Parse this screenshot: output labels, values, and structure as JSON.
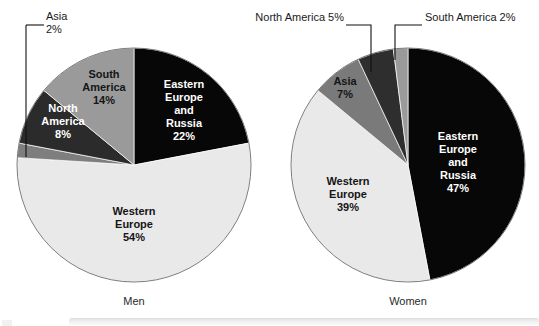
{
  "figure": {
    "background_color": "#ffffff",
    "charts": [
      {
        "id": "men",
        "caption": "Men",
        "caption_x": 134,
        "caption_y": 305,
        "center_x": 134,
        "center_y": 165,
        "radius": 117
      },
      {
        "id": "women",
        "caption": "Women",
        "caption_x": 408,
        "caption_y": 305,
        "center_x": 408,
        "center_y": 165,
        "radius": 117
      }
    ]
  },
  "chart_data": [
    {
      "type": "pie",
      "title": "Men",
      "start_angle_deg": 0,
      "direction": "clockwise",
      "total": 100,
      "unit": "%",
      "categories": [
        "Eastern Europe and Russia",
        "Western Europe",
        "Asia",
        "North America",
        "South America"
      ],
      "values": [
        22,
        54,
        2,
        8,
        14
      ],
      "slices": [
        {
          "label": "Eastern Europe and Russia",
          "label_lines": [
            "Eastern",
            "Europe",
            "and",
            "Russia"
          ],
          "value": 22,
          "value_text": "22%",
          "color": "#070707",
          "text_color": "#ffffff",
          "label_placement": "inside",
          "label_x": 184,
          "label_y": 88
        },
        {
          "label": "Western Europe",
          "label_lines": [
            "Western",
            "Europe"
          ],
          "value": 54,
          "value_text": "54%",
          "color": "#e9e9e9",
          "text_color": "#151515",
          "label_placement": "inside",
          "label_x": 134,
          "label_y": 215
        },
        {
          "label": "Asia",
          "label_lines": [
            "Asia"
          ],
          "value": 2,
          "value_text": "2%",
          "color": "#7e7e7e",
          "text_color": "#1a1a1a",
          "label_placement": "callout",
          "label_x": 46,
          "label_y": 20,
          "leader_points": "26,25 26,157"
        },
        {
          "label": "North America",
          "label_lines": [
            "North",
            "America"
          ],
          "value": 8,
          "value_text": "8%",
          "color": "#2b2b2b",
          "text_color": "#ffffff",
          "label_placement": "inside",
          "label_x": 63,
          "label_y": 112
        },
        {
          "label": "South America",
          "label_lines": [
            "South",
            "America"
          ],
          "value": 14,
          "value_text": "14%",
          "color": "#9a9a9a",
          "text_color": "#151515",
          "label_placement": "inside",
          "label_x": 104,
          "label_y": 78
        }
      ]
    },
    {
      "type": "pie",
      "title": "Women",
      "start_angle_deg": 0,
      "direction": "clockwise",
      "total": 100,
      "unit": "%",
      "categories": [
        "Eastern Europe and Russia",
        "Western Europe",
        "Asia",
        "North America",
        "South America"
      ],
      "values": [
        47,
        39,
        7,
        5,
        2
      ],
      "slices": [
        {
          "label": "Eastern Europe and Russia",
          "label_lines": [
            "Eastern",
            "Europe",
            "and",
            "Russia"
          ],
          "value": 47,
          "value_text": "47%",
          "color": "#070707",
          "text_color": "#ffffff",
          "label_placement": "inside",
          "label_x": 458,
          "label_y": 140
        },
        {
          "label": "Western Europe",
          "label_lines": [
            "Western",
            "Europe"
          ],
          "value": 39,
          "value_text": "39%",
          "color": "#e9e9e9",
          "text_color": "#151515",
          "label_placement": "inside",
          "label_x": 348,
          "label_y": 185
        },
        {
          "label": "Asia",
          "label_lines": [
            "Asia"
          ],
          "value": 7,
          "value_text": "7%",
          "color": "#7a7a7a",
          "text_color": "#151515",
          "label_placement": "inside",
          "label_x": 345,
          "label_y": 85
        },
        {
          "label": "North America",
          "label_lines": [
            "North America"
          ],
          "value": 5,
          "value_text": "5%",
          "color": "#2e2e2e",
          "text_color": "#1a1a1a",
          "label_placement": "callout",
          "label_text": "North America 5%",
          "label_x": 254,
          "label_y": 24,
          "leader_points": "346,25 371,25 371,72"
        },
        {
          "label": "South America",
          "label_lines": [
            "South America"
          ],
          "value": 2,
          "value_text": "2%",
          "color": "#9a9a9a",
          "text_color": "#1a1a1a",
          "label_placement": "callout",
          "label_text": "South America 2%",
          "label_x": 430,
          "label_y": 24,
          "leader_points": "422,25 395,25 395,60"
        }
      ]
    }
  ]
}
